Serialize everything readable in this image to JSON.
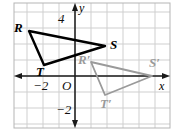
{
  "figure": {
    "background_color": "#ffffff",
    "grid": {
      "line_color": "#cfcfcf",
      "border_color": "#b0b0b0",
      "cell_size_px": 16,
      "origin_px": {
        "x": 75,
        "y": 76
      },
      "left_px": 14,
      "top_px": 3,
      "right_px": 170,
      "bottom_px": 128,
      "x_range": [
        -4,
        6
      ],
      "y_range": [
        -3,
        4
      ]
    },
    "axes": {
      "color": "#1a1a1a",
      "x_axis_label": "x",
      "y_axis_label": "y",
      "origin_label": "O",
      "x_ticks": [
        {
          "value": -2,
          "label": "−2"
        }
      ],
      "y_ticks": [
        {
          "value": 4,
          "label": "4"
        },
        {
          "value": -2,
          "label": "−2"
        }
      ]
    },
    "shapes": [
      {
        "name": "triangle-rst",
        "role": "preimage",
        "color": "#000000",
        "stroke_width": 2.4,
        "fill": "none",
        "vertices": [
          {
            "label": "R",
            "x": -2.9,
            "y": 2.8,
            "px": {
              "x": 29,
              "y": 31
            }
          },
          {
            "label": "S",
            "x": 1.9,
            "y": 1.9,
            "px": {
              "x": 105,
              "y": 46
            }
          },
          {
            "label": "T",
            "x": -1.9,
            "y": 0.7,
            "px": {
              "x": 44,
              "y": 65
            }
          }
        ]
      },
      {
        "name": "triangle-r-prime-s-prime-t-prime",
        "role": "image",
        "color": "#9a9a9a",
        "stroke_width": 1.8,
        "fill": "none",
        "vertices": [
          {
            "label": "R′",
            "x": 1.0,
            "y": 0.9,
            "px": {
              "x": 91,
              "y": 62
            }
          },
          {
            "label": "S′",
            "x": 4.8,
            "y": 0.0,
            "px": {
              "x": 152,
              "y": 76
            }
          },
          {
            "label": "T′",
            "x": 1.9,
            "y": -1.2,
            "px": {
              "x": 105,
              "y": 95
            }
          }
        ]
      }
    ],
    "vertex_labels": [
      {
        "text": "R",
        "px": {
          "x": 15,
          "y": 22
        },
        "style": "preimage"
      },
      {
        "text": "S",
        "px": {
          "x": 110,
          "y": 39
        },
        "style": "preimage"
      },
      {
        "text": "T",
        "px": {
          "x": 36,
          "y": 66
        },
        "style": "preimage"
      },
      {
        "text": "R′",
        "px": {
          "x": 78,
          "y": 54
        },
        "style": "image"
      },
      {
        "text": "S′",
        "px": {
          "x": 150,
          "y": 57
        },
        "style": "image"
      },
      {
        "text": "T′",
        "px": {
          "x": 100,
          "y": 98
        },
        "style": "image"
      }
    ],
    "tick_labels": [
      {
        "text": "−2",
        "px": {
          "x": 33,
          "y": 79
        }
      },
      {
        "text": "O",
        "px": {
          "x": 62,
          "y": 79
        }
      },
      {
        "text": "4",
        "px": {
          "x": 58,
          "y": 13
        }
      },
      {
        "text": "−2",
        "px": {
          "x": 57,
          "y": 104
        }
      }
    ],
    "axis_name_labels": [
      {
        "text": "y",
        "px": {
          "x": 79,
          "y": 3
        }
      },
      {
        "text": "x",
        "px": {
          "x": 160,
          "y": 80
        }
      }
    ]
  }
}
